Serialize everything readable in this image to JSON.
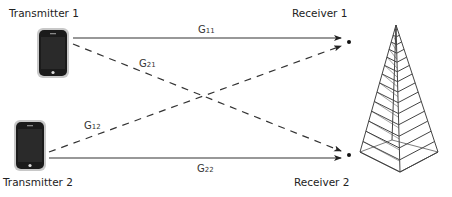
{
  "diagram": {
    "type": "interference channel",
    "nodes": {
      "tx1": {
        "label": "Transmitter 1",
        "icon": "smartphone-icon"
      },
      "tx2": {
        "label": "Transmitter 2",
        "icon": "smartphone-icon"
      },
      "rx1": {
        "label": "Receiver 1"
      },
      "rx2": {
        "label": "Receiver 2"
      },
      "tower": {
        "icon": "cell-tower-icon"
      }
    },
    "links": [
      {
        "id": "g11",
        "symbol": "G",
        "subscript": "11",
        "from": "Transmitter 1",
        "to": "Receiver 1",
        "style": "solid"
      },
      {
        "id": "g21",
        "symbol": "G",
        "subscript": "21",
        "from": "Transmitter 1",
        "to": "Receiver 2",
        "style": "dashed"
      },
      {
        "id": "g12",
        "symbol": "G",
        "subscript": "12",
        "from": "Transmitter 2",
        "to": "Receiver 1",
        "style": "dashed"
      },
      {
        "id": "g22",
        "symbol": "G",
        "subscript": "22",
        "from": "Transmitter 2",
        "to": "Receiver 2",
        "style": "solid"
      }
    ],
    "colors": {
      "line": "#333333",
      "phone_body": "#1a1a1a",
      "phone_frame": "#bdbdbd",
      "tower": "#444444"
    }
  }
}
